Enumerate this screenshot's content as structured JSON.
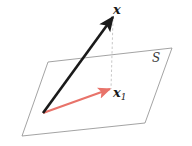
{
  "figure": {
    "type": "vector-projection-diagram",
    "background_color": "#ffffff",
    "labels": {
      "vector_x": "x",
      "vector_x1_base": "x",
      "vector_x1_subscript": "1",
      "subspace_S": "S"
    },
    "colors": {
      "vector_x_color": "#1a1a1a",
      "vector_x1_color": "#e8736a",
      "plane_edge_color": "#8c8c8c",
      "dashed_line_color": "#b0b0b0",
      "label_color": "#1a1a1a",
      "subspace_label_color": "#3a3a3a"
    },
    "geometry": {
      "plane_vertices": "48,62 172,48 145,123 22,136",
      "vector_x_path": "M 43,113 L 113,17",
      "vector_x1_path": "M 43,113 L 110,89",
      "dashed_path": "M 113,19 L 111,89",
      "origin_point": "43,113",
      "vector_x_tip": "113,17",
      "vector_x1_tip": "110,89"
    },
    "stroke_widths": {
      "vector_x": 2.6,
      "vector_x1": 2.2,
      "plane_edge": 0.8,
      "dashed_line": 0.7
    }
  }
}
